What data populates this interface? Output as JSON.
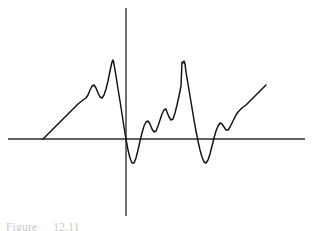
{
  "figure": {
    "caption_label": "Figure",
    "caption_number": "12.11",
    "background_color": "#ffffff",
    "curve_color": "#111111",
    "axis_color": "#2b2b2b"
  },
  "axes": {
    "x_axis_name": "horizontal-axis",
    "y_axis_name": "vertical-axis",
    "x_axis_y_px": 139,
    "y_axis_x_px": 126,
    "x_axis_start_px": 8,
    "x_axis_end_px": 305,
    "y_axis_top_px": 8,
    "y_axis_bottom_px": 216
  },
  "chart_data": {
    "type": "line",
    "xlabel": "",
    "ylabel": "",
    "grid": false,
    "legend": "none",
    "xlim": [
      -2.8,
      2.35
    ],
    "ylim": [
      -1.35,
      1.55
    ],
    "series": [
      {
        "name": "fourier-partial-sum",
        "color": "#111111",
        "points_px": [
          [
            43,
            139
          ],
          [
            48,
            134
          ],
          [
            53,
            129
          ],
          [
            58,
            124
          ],
          [
            63,
            119
          ],
          [
            68,
            114
          ],
          [
            73,
            109
          ],
          [
            78,
            104
          ],
          [
            83,
            100
          ],
          [
            86,
            98
          ],
          [
            88,
            95
          ],
          [
            90,
            90
          ],
          [
            92,
            86
          ],
          [
            94,
            85
          ],
          [
            96,
            88
          ],
          [
            98,
            93
          ],
          [
            100,
            97
          ],
          [
            102,
            98
          ],
          [
            104,
            95
          ],
          [
            106,
            89
          ],
          [
            108,
            81
          ],
          [
            110,
            71
          ],
          [
            112,
            62
          ],
          [
            113,
            60
          ],
          [
            114,
            64
          ],
          [
            116,
            76
          ],
          [
            118,
            89
          ],
          [
            120,
            101
          ],
          [
            122,
            114
          ],
          [
            124,
            127
          ],
          [
            126,
            139
          ],
          [
            128,
            150
          ],
          [
            130,
            158
          ],
          [
            132,
            163
          ],
          [
            134,
            163
          ],
          [
            136,
            158
          ],
          [
            138,
            150
          ],
          [
            140,
            141
          ],
          [
            142,
            133
          ],
          [
            144,
            126
          ],
          [
            146,
            122
          ],
          [
            148,
            121
          ],
          [
            150,
            124
          ],
          [
            152,
            129
          ],
          [
            154,
            132
          ],
          [
            156,
            131
          ],
          [
            158,
            126
          ],
          [
            160,
            120
          ],
          [
            162,
            114
          ],
          [
            164,
            110
          ],
          [
            166,
            109
          ],
          [
            167,
            112
          ],
          [
            169,
            117
          ],
          [
            171,
            120
          ],
          [
            173,
            119
          ],
          [
            175,
            113
          ],
          [
            177,
            105
          ],
          [
            179,
            96
          ],
          [
            181,
            86
          ],
          [
            182,
            62
          ],
          [
            183,
            63
          ],
          [
            184,
            61
          ],
          [
            185,
            64
          ],
          [
            186,
            72
          ],
          [
            188,
            84
          ],
          [
            190,
            96
          ],
          [
            192,
            108
          ],
          [
            194,
            120
          ],
          [
            196,
            131
          ],
          [
            198,
            141
          ],
          [
            200,
            150
          ],
          [
            202,
            157
          ],
          [
            204,
            162
          ],
          [
            206,
            163
          ],
          [
            208,
            160
          ],
          [
            210,
            154
          ],
          [
            212,
            146
          ],
          [
            214,
            138
          ],
          [
            216,
            131
          ],
          [
            218,
            126
          ],
          [
            220,
            123
          ],
          [
            222,
            124
          ],
          [
            224,
            127
          ],
          [
            226,
            130
          ],
          [
            228,
            130
          ],
          [
            230,
            127
          ],
          [
            232,
            123
          ],
          [
            234,
            119
          ],
          [
            236,
            115
          ],
          [
            238,
            112
          ],
          [
            240,
            110
          ],
          [
            242,
            108
          ],
          [
            246,
            105
          ],
          [
            250,
            101
          ],
          [
            254,
            97
          ],
          [
            258,
            93
          ],
          [
            262,
            89
          ],
          [
            266,
            85
          ]
        ]
      }
    ],
    "features": [
      {
        "name": "jump-discontinuity-1",
        "x_px": 126,
        "note": "first sawtooth drop at origin"
      },
      {
        "name": "jump-discontinuity-2",
        "x_px": 194,
        "note": "second sawtooth drop"
      },
      {
        "name": "overshoot-peak-1",
        "x_px": 113,
        "y_px": 60
      },
      {
        "name": "overshoot-peak-2",
        "x_px": 182,
        "y_px": 62
      },
      {
        "name": "undershoot-trough-1",
        "x_px": 134,
        "y_px": 163
      },
      {
        "name": "undershoot-trough-2",
        "x_px": 206,
        "y_px": 163
      },
      {
        "name": "ramp-start-left",
        "x_px": 43,
        "y_px": 139
      },
      {
        "name": "ramp-end-right",
        "x_px": 266,
        "y_px": 85
      }
    ]
  }
}
